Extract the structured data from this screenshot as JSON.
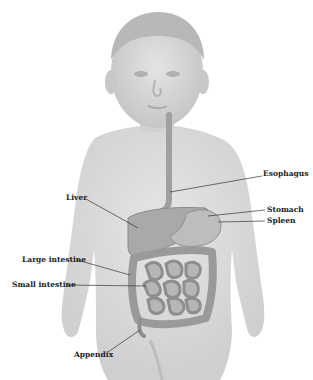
{
  "diagram": {
    "labels": [
      {
        "id": "esophagus",
        "text": "Esophagus",
        "x": 263,
        "y": 174
      },
      {
        "id": "liver",
        "text": "Liver",
        "x": 66,
        "y": 197
      },
      {
        "id": "stomach",
        "text": "Stomach",
        "x": 267,
        "y": 208
      },
      {
        "id": "spleen",
        "text": "Spleen",
        "x": 267,
        "y": 219
      },
      {
        "id": "large-intestine",
        "text": "Large intestine",
        "x": 22,
        "y": 258
      },
      {
        "id": "small-intestine",
        "text": "Small intestine",
        "x": 12,
        "y": 283
      },
      {
        "id": "appendix",
        "text": "Appendix",
        "x": 74,
        "y": 353
      }
    ],
    "colors": {
      "body": "#d9d9d9",
      "body_shade": "#c4c4c4",
      "organ": "#a8a8a8",
      "organ_dark": "#8c8c8c",
      "leader_line": "#333333",
      "text": "#1a1a1a",
      "background": "#ffffff"
    }
  }
}
